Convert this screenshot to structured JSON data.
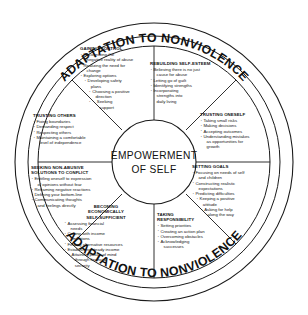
{
  "diagram": {
    "center": {
      "line1": "EMPOWERMENT",
      "line2": "OF SELF"
    },
    "banner_top": "ADAPTATION TO NONVIOLENCE",
    "banner_bottom": "ADAPTATION TO NONVIOLENCE",
    "colors": {
      "stroke": "#1a1a1a",
      "text": "#111111",
      "background": "#ffffff"
    },
    "sectors": [
      {
        "id": "gaining-control",
        "title": "GAINING CONTROL",
        "items": [
          {
            "text": "Recognizing the",
            "indent": 0,
            "cont": false
          },
          {
            "text": "negative reality of abuse",
            "indent": 0,
            "cont": true
          },
          {
            "text": "Realizing the need for",
            "indent": 0,
            "cont": false
          },
          {
            "text": "change",
            "indent": 0,
            "cont": true
          },
          {
            "text": "Exploring options",
            "indent": 0,
            "cont": false
          },
          {
            "text": "Developing safety",
            "indent": 1,
            "cont": false
          },
          {
            "text": "plans",
            "indent": 1,
            "cont": true
          },
          {
            "text": "Choosing a positive",
            "indent": 2,
            "cont": false
          },
          {
            "text": "direction",
            "indent": 2,
            "cont": true
          },
          {
            "text": "Seeking",
            "indent": 3,
            "cont": false
          },
          {
            "text": "support",
            "indent": 3,
            "cont": true
          }
        ]
      },
      {
        "id": "rebuilding-self-esteem",
        "title": "REBUILDING SELF-ESTEEM",
        "items": [
          {
            "text": "Believing there is no just",
            "indent": 0,
            "cont": false
          },
          {
            "text": "cause for abuse",
            "indent": 0,
            "cont": true
          },
          {
            "text": "Letting go of guilt",
            "indent": 0,
            "cont": false
          },
          {
            "text": "Identifying strengths",
            "indent": 0,
            "cont": false
          },
          {
            "text": "Incorporating",
            "indent": 0,
            "cont": false
          },
          {
            "text": "strengths into",
            "indent": 0,
            "cont": true
          },
          {
            "text": "daily living",
            "indent": 0,
            "cont": true
          }
        ]
      },
      {
        "id": "trusting-oneself",
        "title": "TRUSTING ONESELF",
        "items": [
          {
            "text": "Taking small risks",
            "indent": 0,
            "cont": false
          },
          {
            "text": "Making decisions",
            "indent": 0,
            "cont": false
          },
          {
            "text": "Accepting outcomes",
            "indent": 0,
            "cont": false
          },
          {
            "text": "Understanding  mistakes",
            "indent": 0,
            "cont": false
          },
          {
            "text": "as opportunities for",
            "indent": 0,
            "cont": true
          },
          {
            "text": "growth",
            "indent": 0,
            "cont": true
          }
        ]
      },
      {
        "id": "setting-goals",
        "title": "SETTING GOALS",
        "items": [
          {
            "text": "Focusing on needs of self",
            "indent": 0,
            "cont": false
          },
          {
            "text": "and children",
            "indent": 0,
            "cont": true
          },
          {
            "text": "Constructing realistic",
            "indent": 0,
            "cont": false
          },
          {
            "text": "expectations",
            "indent": 0,
            "cont": true
          },
          {
            "text": "Predicting difficulties",
            "indent": 0,
            "cont": false
          },
          {
            "text": "Keeping a positive",
            "indent": 1,
            "cont": false
          },
          {
            "text": "attitude",
            "indent": 1,
            "cont": true
          },
          {
            "text": "Asking for help",
            "indent": 2,
            "cont": false
          },
          {
            "text": "along the way",
            "indent": 2,
            "cont": true
          }
        ]
      },
      {
        "id": "taking-responsibility",
        "title": "TAKING\nRESPONSIBILITY",
        "items": [
          {
            "text": "Setting priorities",
            "indent": 0,
            "cont": false
          },
          {
            "text": "Creating an action plan",
            "indent": 0,
            "cont": false
          },
          {
            "text": "Overcoming obstacles",
            "indent": 0,
            "cont": false
          },
          {
            "text": "Acknowledging",
            "indent": 0,
            "cont": false
          },
          {
            "text": "successes",
            "indent": 0,
            "cont": true
          }
        ]
      },
      {
        "id": "becoming-economically-self-sufficient",
        "title": "BECOMING\nECONOMICALLY\nSELF-SUFFICIENT",
        "items": [
          {
            "text": "Assessing financial",
            "indent": 0,
            "cont": false
          },
          {
            "text": "needs",
            "indent": 0,
            "cont": true
          },
          {
            "text": "Coping with income",
            "indent": 0,
            "cont": false
          },
          {
            "text": "limitations",
            "indent": 0,
            "cont": true
          },
          {
            "text": "Finding alternative resources",
            "indent": 0,
            "cont": false
          },
          {
            "text": "Establishing steady income",
            "indent": 0,
            "cont": false
          },
          {
            "text": "Attaining peace of mind",
            "indent": 1,
            "cont": false
          },
          {
            "text": "through financial",
            "indent": 1,
            "cont": true
          },
          {
            "text": "security",
            "indent": 1,
            "cont": true
          }
        ]
      },
      {
        "id": "seeking-non-abusive-solutions",
        "title": "SEEKING NON-ABUSIVE\nSOLUTIONS TO CONFLICT",
        "items": [
          {
            "text": "Entitling oneself to expression",
            "indent": 0,
            "cont": false
          },
          {
            "text": "of opinions without fear",
            "indent": 0,
            "cont": true
          },
          {
            "text": "Reframing negative reactions",
            "indent": 0,
            "cont": false
          },
          {
            "text": "Defining your bottom-line",
            "indent": 0,
            "cont": false
          },
          {
            "text": "Communicating thoughts",
            "indent": 0,
            "cont": false
          },
          {
            "text": "and feelings directly",
            "indent": 0,
            "cont": true
          }
        ]
      },
      {
        "id": "trusting-others",
        "title": "TRUSTING OTHERS",
        "items": [
          {
            "text": "Fixing boundaries",
            "indent": 0,
            "cont": false
          },
          {
            "text": "Demanding respect",
            "indent": 0,
            "cont": false
          },
          {
            "text": "Respecting others",
            "indent": 0,
            "cont": false
          },
          {
            "text": "Maintaining a comfortable",
            "indent": 0,
            "cont": false
          },
          {
            "text": "level of independence",
            "indent": 0,
            "cont": true
          }
        ]
      }
    ]
  }
}
